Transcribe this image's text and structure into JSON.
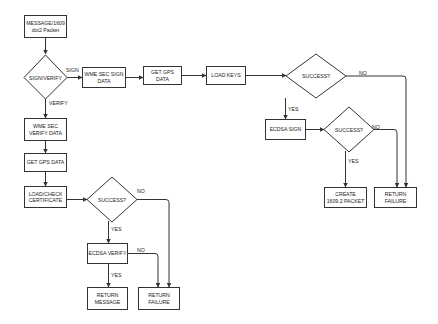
{
  "diagram": {
    "type": "flowchart",
    "nodes": {
      "message_packet": {
        "label": "MESSAGE/1609\ndot2 Packet",
        "shape": "rect"
      },
      "sign_verify": {
        "label": "SIGN/VERIFY",
        "shape": "diamond"
      },
      "wme_sec_sign_data": {
        "label": "WME SEC SIGN\nDATA",
        "shape": "rect"
      },
      "get_gps_data_sign": {
        "label": "GET GPS DATA",
        "shape": "rect"
      },
      "load_keys": {
        "label": "LOAD KEYS",
        "shape": "rect"
      },
      "success_keys": {
        "label": "SUCCESS?",
        "shape": "diamond"
      },
      "ecdsa_sign": {
        "label": "ECDSA SIGN",
        "shape": "rect"
      },
      "success_sign": {
        "label": "SUCCESS?",
        "shape": "diamond"
      },
      "create_packet": {
        "label": "CREATE\n1609.2 PACKET",
        "shape": "rect"
      },
      "return_failure_sign": {
        "label": "RETURN\nFAILURE",
        "shape": "rect"
      },
      "wme_sec_verify_data": {
        "label": "WME SEC\nVERIFY DATA",
        "shape": "rect"
      },
      "get_gps_data_verify": {
        "label": "GET GPS DATA",
        "shape": "rect"
      },
      "load_check_certificate": {
        "label": "LOAD/CHECK\nCERTIFICATE",
        "shape": "rect"
      },
      "success_cert": {
        "label": "SUCCESS?",
        "shape": "diamond"
      },
      "ecdsa_verify": {
        "label": "ECDSA VERIFY",
        "shape": "rect"
      },
      "return_message": {
        "label": "RETURN\nMESSAGE",
        "shape": "rect"
      },
      "return_failure_verify": {
        "label": "RETURN\nFAILURE",
        "shape": "rect"
      }
    },
    "edge_labels": {
      "sign": "SIGN",
      "verify": "VERIFY",
      "keys_no": "NO",
      "keys_yes": "YES",
      "sign_no": "NO",
      "sign_yes": "YES",
      "cert_no": "NO",
      "cert_yes": "YES",
      "verify_no": "NO",
      "verify_yes": "YES"
    },
    "edges": [
      {
        "from": "message_packet",
        "to": "sign_verify"
      },
      {
        "from": "sign_verify",
        "to": "wme_sec_sign_data",
        "label": "SIGN"
      },
      {
        "from": "sign_verify",
        "to": "wme_sec_verify_data",
        "label": "VERIFY"
      },
      {
        "from": "wme_sec_sign_data",
        "to": "get_gps_data_sign"
      },
      {
        "from": "get_gps_data_sign",
        "to": "load_keys"
      },
      {
        "from": "load_keys",
        "to": "success_keys"
      },
      {
        "from": "success_keys",
        "to": "ecdsa_sign",
        "label": "YES"
      },
      {
        "from": "success_keys",
        "to": "return_failure_sign",
        "label": "NO"
      },
      {
        "from": "ecdsa_sign",
        "to": "success_sign"
      },
      {
        "from": "success_sign",
        "to": "create_packet",
        "label": "YES"
      },
      {
        "from": "success_sign",
        "to": "return_failure_sign",
        "label": "NO"
      },
      {
        "from": "wme_sec_verify_data",
        "to": "get_gps_data_verify"
      },
      {
        "from": "get_gps_data_verify",
        "to": "load_check_certificate"
      },
      {
        "from": "load_check_certificate",
        "to": "success_cert"
      },
      {
        "from": "success_cert",
        "to": "ecdsa_verify",
        "label": "YES"
      },
      {
        "from": "success_cert",
        "to": "return_failure_verify",
        "label": "NO"
      },
      {
        "from": "ecdsa_verify",
        "to": "return_message",
        "label": "YES"
      },
      {
        "from": "ecdsa_verify",
        "to": "return_failure_verify",
        "label": "NO"
      }
    ]
  }
}
